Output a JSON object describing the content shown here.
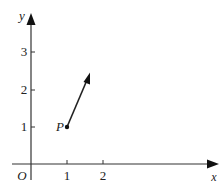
{
  "diagram": {
    "axes": {
      "x_label": "x",
      "y_label": "y",
      "origin_label": "O",
      "x_ticks": [
        "1",
        "2"
      ],
      "y_ticks": [
        "1",
        "2",
        "3"
      ]
    },
    "point": {
      "label": "P",
      "x": 1,
      "y": 1
    },
    "vector": {
      "from": [
        1,
        1
      ],
      "to": [
        1.65,
        2.5
      ]
    },
    "colors": {
      "ink": "#222222",
      "background": "#ffffff"
    }
  }
}
